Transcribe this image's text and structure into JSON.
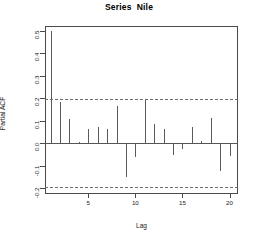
{
  "chart_data": {
    "type": "bar",
    "title": "Series  Nile",
    "subtitle": "",
    "xlabel": "Lag",
    "ylabel": "Partial ACF",
    "grid": false,
    "legend_position": "none",
    "xlim": [
      0.4,
      20.9
    ],
    "ylim": [
      -0.225,
      0.52
    ],
    "xticks": [
      5,
      10,
      15,
      20
    ],
    "xtick_labels": [
      "5",
      "10",
      "15",
      "20"
    ],
    "yticks": [
      -0.2,
      -0.1,
      0.0,
      0.1,
      0.2,
      0.3,
      0.4,
      0.5
    ],
    "ytick_labels": [
      "-0.2",
      "-0.1",
      "0.0",
      "0.1",
      "0.2",
      "0.3",
      "0.4",
      "0.5"
    ],
    "confidence_bands": [
      0.195,
      -0.195
    ],
    "categories": [
      1,
      2,
      3,
      4,
      5,
      6,
      7,
      8,
      9,
      10,
      11,
      12,
      13,
      14,
      15,
      16,
      17,
      18,
      19,
      20
    ],
    "values": [
      0.498,
      0.182,
      0.108,
      0.004,
      0.063,
      0.07,
      0.062,
      0.164,
      -0.15,
      -0.063,
      0.191,
      0.085,
      0.063,
      -0.052,
      -0.027,
      0.07,
      0.011,
      0.11,
      -0.122,
      -0.056
    ],
    "series": [
      {
        "name": "Partial ACF",
        "values": [
          0.498,
          0.182,
          0.108,
          0.004,
          0.063,
          0.07,
          0.062,
          0.164,
          -0.15,
          -0.063,
          0.191,
          0.085,
          0.063,
          -0.052,
          -0.027,
          0.07,
          0.011,
          0.11,
          -0.122,
          -0.056
        ]
      }
    ],
    "annotations": []
  },
  "colors": {
    "stem": "#5a5a5a",
    "frame": "#4a4a4a",
    "ci": "#6d6d6d",
    "text": "#1a1a1a",
    "background": "#ffffff"
  }
}
